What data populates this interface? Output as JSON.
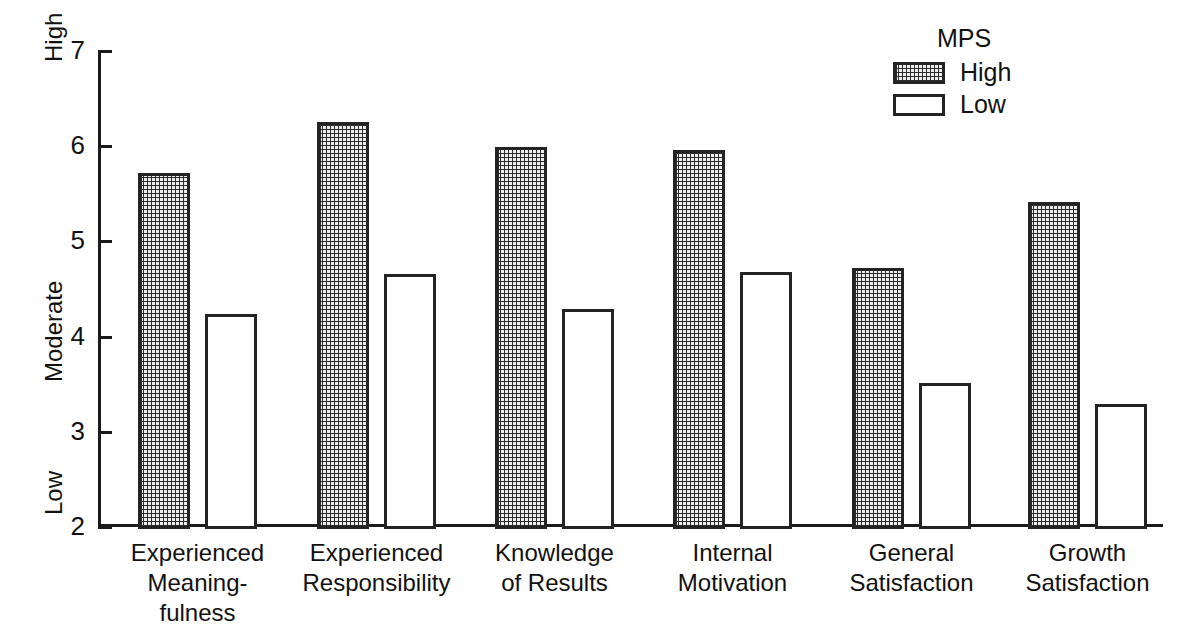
{
  "chart_data": {
    "type": "bar",
    "title": "",
    "xlabel": "",
    "ylabel": "",
    "ylim": [
      2,
      7
    ],
    "yticks": [
      2,
      3,
      4,
      5,
      6,
      7
    ],
    "ytick_labels": [
      "2",
      "3",
      "4",
      "5",
      "6",
      "7"
    ],
    "y_anchor_labels": [
      {
        "text": "High",
        "value": 7
      },
      {
        "text": "Moderate",
        "value": 4.5
      },
      {
        "text": "Low",
        "value": 2.3
      }
    ],
    "grid": false,
    "legend": {
      "title": "MPS",
      "position": "top-right",
      "entries": [
        {
          "label": "High",
          "pattern": "stippled",
          "color": "#efefef"
        },
        {
          "label": "Low",
          "pattern": "open",
          "color": "#ffffff"
        }
      ]
    },
    "categories": [
      "Experienced\nMeaning-\nfulness",
      "Experienced\nResponsibility",
      "Knowledge\nof Results",
      "Internal\nMotivation",
      "General\nSatisfaction",
      "Growth\nSatisfaction"
    ],
    "series": [
      {
        "name": "High",
        "values": [
          5.72,
          6.25,
          5.99,
          5.96,
          4.72,
          5.41
        ]
      },
      {
        "name": "Low",
        "values": [
          4.24,
          4.66,
          4.29,
          4.68,
          3.51,
          3.29
        ]
      }
    ]
  },
  "figure": {
    "background": "#ffffff",
    "ink_color": "#1a1a1a"
  }
}
